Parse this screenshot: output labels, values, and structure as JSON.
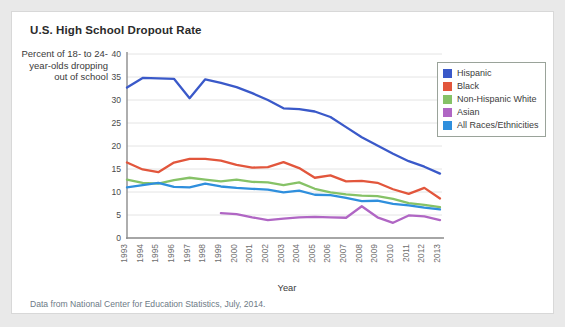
{
  "chart_title": "U.S. High School Dropout Rate",
  "y_axis_caption": "Percent of 18- to 24-year-olds dropping out of school",
  "x_axis_label": "Year",
  "source_note": "Data from National Center for Education Statistics, July, 2014.",
  "legend": {
    "items": [
      {
        "label": "Hispanic",
        "color": "#3a59c9"
      },
      {
        "label": "Black",
        "color": "#e2563c"
      },
      {
        "label": "Non-Hispanic White",
        "color": "#86c267"
      },
      {
        "label": "Asian",
        "color": "#b066c4"
      },
      {
        "label": "All Races/Ethnicities",
        "color": "#2f8fdd"
      }
    ]
  },
  "chart_data": {
    "type": "line",
    "title": "U.S. High School Dropout Rate",
    "subtitle": "",
    "xlabel": "Year",
    "ylabel": "Percent of 18- to 24-year-olds dropping out of school",
    "xlim": [
      1993,
      2013
    ],
    "ylim": [
      0,
      40
    ],
    "ytick_values": [
      0,
      5,
      10,
      15,
      20,
      25,
      30,
      35,
      40
    ],
    "ytick_labels": [
      "0",
      "5",
      "10",
      "15",
      "20",
      "25",
      "30",
      "35",
      "40"
    ],
    "grid": true,
    "legend_position": "upper-right-inside",
    "categories": [
      1993,
      1994,
      1995,
      1996,
      1997,
      1998,
      1999,
      2000,
      2001,
      2002,
      2003,
      2004,
      2005,
      2006,
      2007,
      2008,
      2009,
      2010,
      2011,
      2012,
      2013
    ],
    "xtick_labels": [
      "1993",
      "1994",
      "1995",
      "1996",
      "1997",
      "1998",
      "1999",
      "2000",
      "2001",
      "2002",
      "2003",
      "2004",
      "2005",
      "2006",
      "2007",
      "2008",
      "2009",
      "2010",
      "2011",
      "2012",
      "2013"
    ],
    "series": [
      {
        "name": "Hispanic",
        "color": "#3a59c9",
        "values": [
          32.7,
          34.8,
          34.7,
          34.6,
          30.4,
          34.5,
          33.7,
          32.8,
          31.5,
          30.0,
          28.2,
          28.0,
          27.5,
          26.3,
          24.1,
          21.9,
          20.1,
          18.3,
          16.7,
          15.5,
          14.0
        ]
      },
      {
        "name": "Black",
        "color": "#e2563c",
        "values": [
          16.4,
          14.9,
          14.3,
          16.4,
          17.2,
          17.2,
          16.8,
          15.9,
          15.3,
          15.4,
          16.5,
          15.2,
          13.1,
          13.6,
          12.3,
          12.4,
          12.0,
          10.6,
          9.6,
          10.9,
          8.6
        ]
      },
      {
        "name": "Non-Hispanic White",
        "color": "#86c267",
        "values": [
          12.7,
          12.0,
          11.8,
          12.6,
          13.1,
          12.7,
          12.3,
          12.7,
          12.2,
          12.1,
          11.5,
          12.1,
          10.7,
          9.9,
          9.5,
          9.2,
          9.1,
          8.5,
          7.6,
          7.2,
          6.7
        ]
      },
      {
        "name": "Asian",
        "color": "#b066c4",
        "values": [
          null,
          null,
          null,
          null,
          null,
          null,
          5.4,
          5.2,
          4.5,
          3.9,
          4.2,
          4.5,
          4.6,
          4.5,
          4.4,
          6.9,
          4.5,
          3.3,
          4.9,
          4.7,
          3.9
        ]
      },
      {
        "name": "All Races/Ethnicities",
        "color": "#2f8fdd",
        "values": [
          11.0,
          11.5,
          12.0,
          11.1,
          11.0,
          11.8,
          11.2,
          10.9,
          10.7,
          10.5,
          9.9,
          10.3,
          9.4,
          9.3,
          8.7,
          8.0,
          8.1,
          7.4,
          7.1,
          6.6,
          6.2
        ]
      }
    ]
  }
}
